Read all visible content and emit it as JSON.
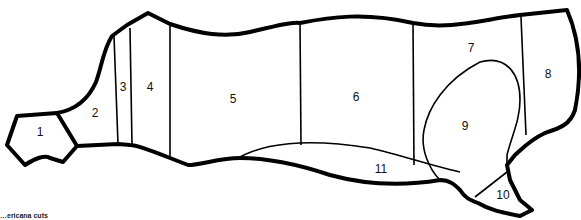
{
  "diagram": {
    "type": "meat-cuts-outline",
    "regions": [
      {
        "id": 1,
        "label": "1",
        "x": 40,
        "y": 133
      },
      {
        "id": 2,
        "label": "2",
        "x": 95,
        "y": 114
      },
      {
        "id": 3,
        "label": "3",
        "x": 123,
        "y": 88
      },
      {
        "id": 4,
        "label": "4",
        "x": 150,
        "y": 88
      },
      {
        "id": 5,
        "label": "5",
        "x": 233,
        "y": 100
      },
      {
        "id": 6,
        "label": "6",
        "x": 356,
        "y": 98
      },
      {
        "id": 7,
        "label": "7",
        "x": 471,
        "y": 49
      },
      {
        "id": 8,
        "label": "8",
        "x": 548,
        "y": 75
      },
      {
        "id": 9,
        "label": "9",
        "x": 465,
        "y": 127
      },
      {
        "id": 10,
        "label": "10",
        "x": 503,
        "y": 196
      },
      {
        "id": 11,
        "label": "11",
        "x": 381,
        "y": 170
      }
    ],
    "caption": "…ericana cuts"
  }
}
